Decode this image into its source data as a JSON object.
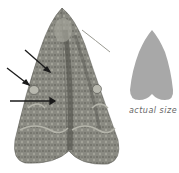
{
  "figure": {
    "caption": "actual size",
    "arrows": 3,
    "colors": {
      "moth_base": "#8a8a82",
      "moth_dark": "#4e4e48",
      "moth_light": "#b5b5ab",
      "silhouette": "#a8a8a8",
      "caption_text": "#666666",
      "arrow": "#1a1a1a"
    }
  }
}
